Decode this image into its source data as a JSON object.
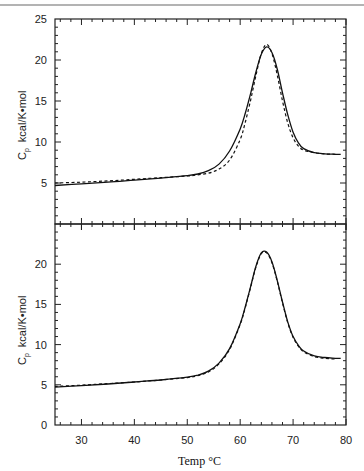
{
  "page": {
    "top_rule_color": "#9a9a9a"
  },
  "chart_data": [
    {
      "type": "line",
      "panel": "top",
      "title": "",
      "xlabel": "Temp °C",
      "ylabel": "Cp  kcal/K•mol",
      "xlim": [
        25,
        80
      ],
      "ylim": [
        0,
        25
      ],
      "yticks": [
        5,
        10,
        15,
        20,
        25
      ],
      "xticks": [],
      "grid": false,
      "legend": null,
      "series": [
        {
          "name": "experimental",
          "style": "solid",
          "x": [
            25,
            30,
            35,
            40,
            45,
            50,
            52,
            54,
            56,
            58,
            60,
            61,
            62,
            63,
            64,
            65,
            66,
            67,
            68,
            69,
            70,
            71,
            72,
            74,
            76,
            78,
            79
          ],
          "y": [
            4.7,
            4.9,
            5.1,
            5.35,
            5.6,
            5.9,
            6.1,
            6.5,
            7.3,
            8.9,
            11.6,
            13.6,
            16.0,
            18.6,
            20.7,
            21.6,
            20.9,
            18.9,
            16.0,
            13.3,
            11.2,
            9.9,
            9.2,
            8.7,
            8.55,
            8.5,
            8.5
          ]
        },
        {
          "name": "fit",
          "style": "dashed",
          "x": [
            25,
            30,
            35,
            40,
            45,
            50,
            52,
            54,
            56,
            58,
            60,
            61,
            62,
            63,
            64,
            65,
            66,
            67,
            68,
            69,
            70,
            71,
            72,
            74,
            76,
            78
          ],
          "y": [
            5.0,
            5.1,
            5.25,
            5.45,
            5.65,
            5.85,
            6.0,
            6.2,
            6.7,
            7.8,
            10.3,
            12.5,
            15.2,
            18.2,
            20.8,
            21.9,
            20.8,
            18.2,
            15.0,
            12.3,
            10.5,
            9.5,
            9.0,
            8.7,
            8.55,
            8.5
          ]
        }
      ]
    },
    {
      "type": "line",
      "panel": "bottom",
      "title": "",
      "xlabel": "Temp °C",
      "ylabel": "Cp  kcal/K•mol",
      "xlim": [
        25,
        80
      ],
      "ylim": [
        0,
        25
      ],
      "yticks": [
        0,
        5,
        10,
        15,
        20
      ],
      "xticks": [
        30,
        40,
        50,
        60,
        70,
        80
      ],
      "grid": false,
      "legend": null,
      "series": [
        {
          "name": "experimental",
          "style": "solid",
          "x": [
            25,
            30,
            35,
            40,
            45,
            50,
            52,
            54,
            56,
            58,
            60,
            61,
            62,
            63,
            64,
            65,
            66,
            67,
            68,
            69,
            70,
            71,
            72,
            74,
            76,
            78,
            79
          ],
          "y": [
            4.7,
            4.9,
            5.1,
            5.35,
            5.6,
            5.95,
            6.2,
            6.7,
            7.7,
            9.5,
            12.6,
            14.8,
            17.3,
            19.8,
            21.4,
            21.5,
            20.3,
            18.0,
            15.3,
            12.8,
            11.0,
            9.9,
            9.2,
            8.6,
            8.4,
            8.3,
            8.3
          ]
        },
        {
          "name": "fit",
          "style": "dashed",
          "x": [
            25,
            30,
            35,
            40,
            45,
            50,
            52,
            54,
            56,
            58,
            60,
            61,
            62,
            63,
            64,
            65,
            66,
            67,
            68,
            69,
            70,
            71,
            72,
            74,
            76,
            78
          ],
          "y": [
            4.8,
            4.95,
            5.15,
            5.35,
            5.6,
            5.9,
            6.15,
            6.6,
            7.6,
            9.4,
            12.5,
            14.7,
            17.2,
            19.7,
            21.3,
            21.4,
            20.2,
            17.9,
            15.2,
            12.7,
            10.9,
            9.8,
            9.1,
            8.5,
            8.3,
            8.2
          ]
        }
      ]
    }
  ],
  "labels": {
    "ylabel_symbol": "C",
    "ylabel_subscript": "p",
    "ylabel_units": "kcal/K•mol",
    "xlabel": "Temp  °C"
  }
}
